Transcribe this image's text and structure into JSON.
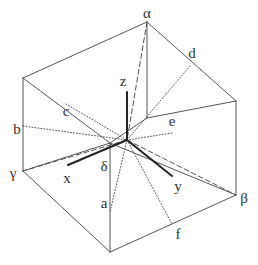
{
  "diagram": {
    "type": "box-with-internal-axes",
    "stroke_color": "#555555",
    "axis_color": "#222222",
    "background": "#ffffff",
    "vertices": {
      "alpha": [
        147,
        22
      ],
      "top_left": [
        23,
        78
      ],
      "top_right": [
        236,
        101
      ],
      "top_front_inner": [
        110,
        187
      ],
      "gamma": [
        23,
        171
      ],
      "beta": [
        236,
        195
      ],
      "bottom_front": [
        110,
        252
      ],
      "center": [
        127,
        140
      ]
    },
    "labels": [
      {
        "id": "alpha",
        "text": "α",
        "x": 147,
        "y": 18
      },
      {
        "id": "beta",
        "text": "β",
        "x": 244,
        "y": 203
      },
      {
        "id": "gamma",
        "text": "γ",
        "x": 13,
        "y": 178
      },
      {
        "id": "delta",
        "text": "δ",
        "x": 104,
        "y": 171
      },
      {
        "id": "a",
        "text": "a",
        "x": 104,
        "y": 208
      },
      {
        "id": "b",
        "text": "b",
        "x": 17,
        "y": 134
      },
      {
        "id": "c",
        "text": "c",
        "x": 66,
        "y": 116
      },
      {
        "id": "d",
        "text": "d",
        "x": 192,
        "y": 58
      },
      {
        "id": "e",
        "text": "e",
        "x": 172,
        "y": 126
      },
      {
        "id": "f",
        "text": "f",
        "x": 178,
        "y": 239
      },
      {
        "id": "x",
        "text": "x",
        "x": 67,
        "y": 183
      },
      {
        "id": "y",
        "text": "y",
        "x": 178,
        "y": 191
      },
      {
        "id": "z",
        "text": "z",
        "x": 123,
        "y": 86
      }
    ],
    "solid_edges": [
      [
        [
          23,
          78
        ],
        [
          147,
          22
        ]
      ],
      [
        [
          147,
          22
        ],
        [
          236,
          101
        ]
      ],
      [
        [
          23,
          78
        ],
        [
          23,
          171
        ]
      ],
      [
        [
          236,
          101
        ],
        [
          236,
          195
        ]
      ],
      [
        [
          23,
          78
        ],
        [
          110,
          143
        ]
      ],
      [
        [
          23,
          171
        ],
        [
          110,
          252
        ]
      ],
      [
        [
          110,
          252
        ],
        [
          236,
          195
        ]
      ],
      [
        [
          110,
          143
        ],
        [
          110,
          252
        ]
      ],
      [
        [
          147,
          22
        ],
        [
          147,
          118
        ]
      ],
      [
        [
          147,
          118
        ],
        [
          236,
          101
        ]
      ],
      [
        [
          147,
          118
        ],
        [
          110,
          143
        ]
      ],
      [
        [
          110,
          143
        ],
        [
          236,
          195
        ]
      ],
      [
        [
          23,
          171
        ],
        [
          110,
          143
        ]
      ]
    ],
    "dashed_edges": [
      [
        [
          147,
          22
        ],
        [
          127,
          140
        ]
      ],
      [
        [
          127,
          140
        ],
        [
          236,
          195
        ]
      ],
      [
        [
          127,
          140
        ],
        [
          23,
          171
        ]
      ]
    ],
    "dotted_edges": [
      [
        [
          23,
          126
        ],
        [
          127,
          140
        ]
      ],
      [
        [
          66,
          104
        ],
        [
          127,
          140
        ]
      ],
      [
        [
          190,
          66
        ],
        [
          127,
          140
        ]
      ],
      [
        [
          172,
          133
        ],
        [
          127,
          140
        ]
      ],
      [
        [
          127,
          140
        ],
        [
          110,
          212
        ]
      ],
      [
        [
          127,
          140
        ],
        [
          172,
          224
        ]
      ]
    ],
    "axes": [
      {
        "name": "z",
        "from": [
          127,
          140
        ],
        "to": [
          127,
          92
        ]
      },
      {
        "name": "x",
        "from": [
          127,
          140
        ],
        "to": [
          68,
          165
        ]
      },
      {
        "name": "y",
        "from": [
          127,
          140
        ],
        "to": [
          172,
          176
        ]
      }
    ]
  }
}
